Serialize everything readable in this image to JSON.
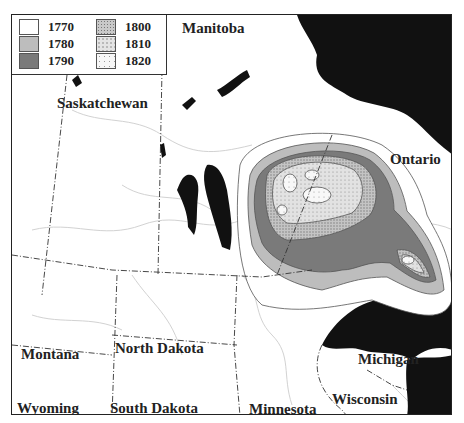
{
  "map": {
    "title": "Range expansion map",
    "legend": {
      "items": [
        {
          "year": "1770",
          "fill": "#ffffff",
          "pattern": "none"
        },
        {
          "year": "1780",
          "fill": "#bdbdbd",
          "pattern": "none"
        },
        {
          "year": "1790",
          "fill": "#7a7a7a",
          "pattern": "none"
        },
        {
          "year": "1800",
          "fill": "#c9c9c9",
          "pattern": "dense-dots"
        },
        {
          "year": "1810",
          "fill": "#e4e4e4",
          "pattern": "dots"
        },
        {
          "year": "1820",
          "fill": "#f7f7f7",
          "pattern": "sparse-dots"
        }
      ]
    },
    "regions": {
      "manitoba": "Manitoba",
      "saskatchewan": "Saskatchewan",
      "ontario": "Ontario",
      "montana": "Montana",
      "north_dakota": "North Dakota",
      "south_dakota": "South Dakota",
      "wyoming": "Wyoming",
      "minnesota": "Minnesota",
      "michigan": "Michigan",
      "wisconsin": "Wisconsin"
    },
    "colors": {
      "water": "#111111",
      "border": "#333333",
      "river": "#cfcfcf"
    }
  }
}
